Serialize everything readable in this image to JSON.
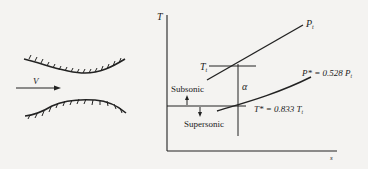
{
  "nozzle": {
    "velocity_label": "V"
  },
  "ts_diagram": {
    "y_axis_label": "T",
    "x_axis_label": "s",
    "stagnation_temp_label": "T",
    "stagnation_temp_sub": "t",
    "stagnation_pressure_label": "P",
    "stagnation_pressure_sub": "t",
    "critical_pressure_label": "P* = 0.528 P",
    "critical_pressure_sub": "t",
    "critical_temp_label": "T* = 0.833 T",
    "critical_temp_sub": "t",
    "alpha_label": "α",
    "subsonic_label": "Subsonic",
    "supersonic_label": "Supersonic"
  },
  "colors": {
    "ink": "#222222",
    "background": "#f4f3f1"
  }
}
